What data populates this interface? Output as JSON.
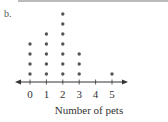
{
  "part_label": "b.",
  "chart_data": {
    "type": "dot-plot",
    "title": "",
    "xlabel": "Number of pets",
    "ylabel": "",
    "categories": [
      "0",
      "1",
      "2",
      "3",
      "4",
      "5"
    ],
    "values": [
      4,
      5,
      7,
      3,
      0,
      1
    ],
    "xlim": [
      0,
      5
    ],
    "grid": false,
    "legend": null,
    "axis_arrows": true,
    "colors": {
      "dot": "#555555",
      "axis": "#333333"
    }
  }
}
